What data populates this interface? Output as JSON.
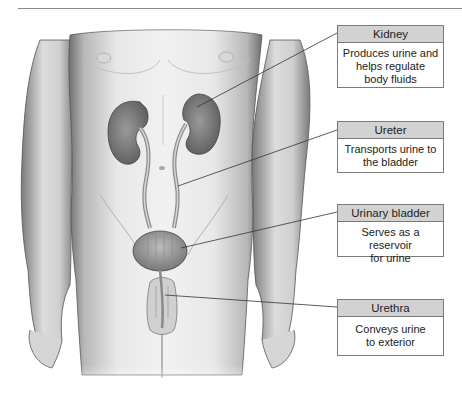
{
  "figure": {
    "callouts": [
      {
        "title": "Kidney",
        "description": "Produces urine and helps regulate body fluids",
        "lines": [
          "Produces urine and",
          "helps regulate",
          "body fluids"
        ]
      },
      {
        "title": "Ureter",
        "description": "Transports urine to the bladder",
        "lines": [
          "Transports urine to",
          "the bladder"
        ]
      },
      {
        "title": "Urinary bladder",
        "description": "Serves as a reservoir for urine",
        "lines": [
          "Serves as a reservoir",
          "for urine"
        ]
      },
      {
        "title": "Urethra",
        "description": "Conveys urine to exterior",
        "lines": [
          "Conveys urine",
          "to exterior"
        ]
      }
    ]
  },
  "colors": {
    "header_fill": "#d2d2d2",
    "border": "#7a7a7a",
    "skin_light": "#e9e9e9",
    "skin_shadow": "#8c8c8c",
    "organ": "#7d7d7d",
    "leader_line": "#333333"
  }
}
